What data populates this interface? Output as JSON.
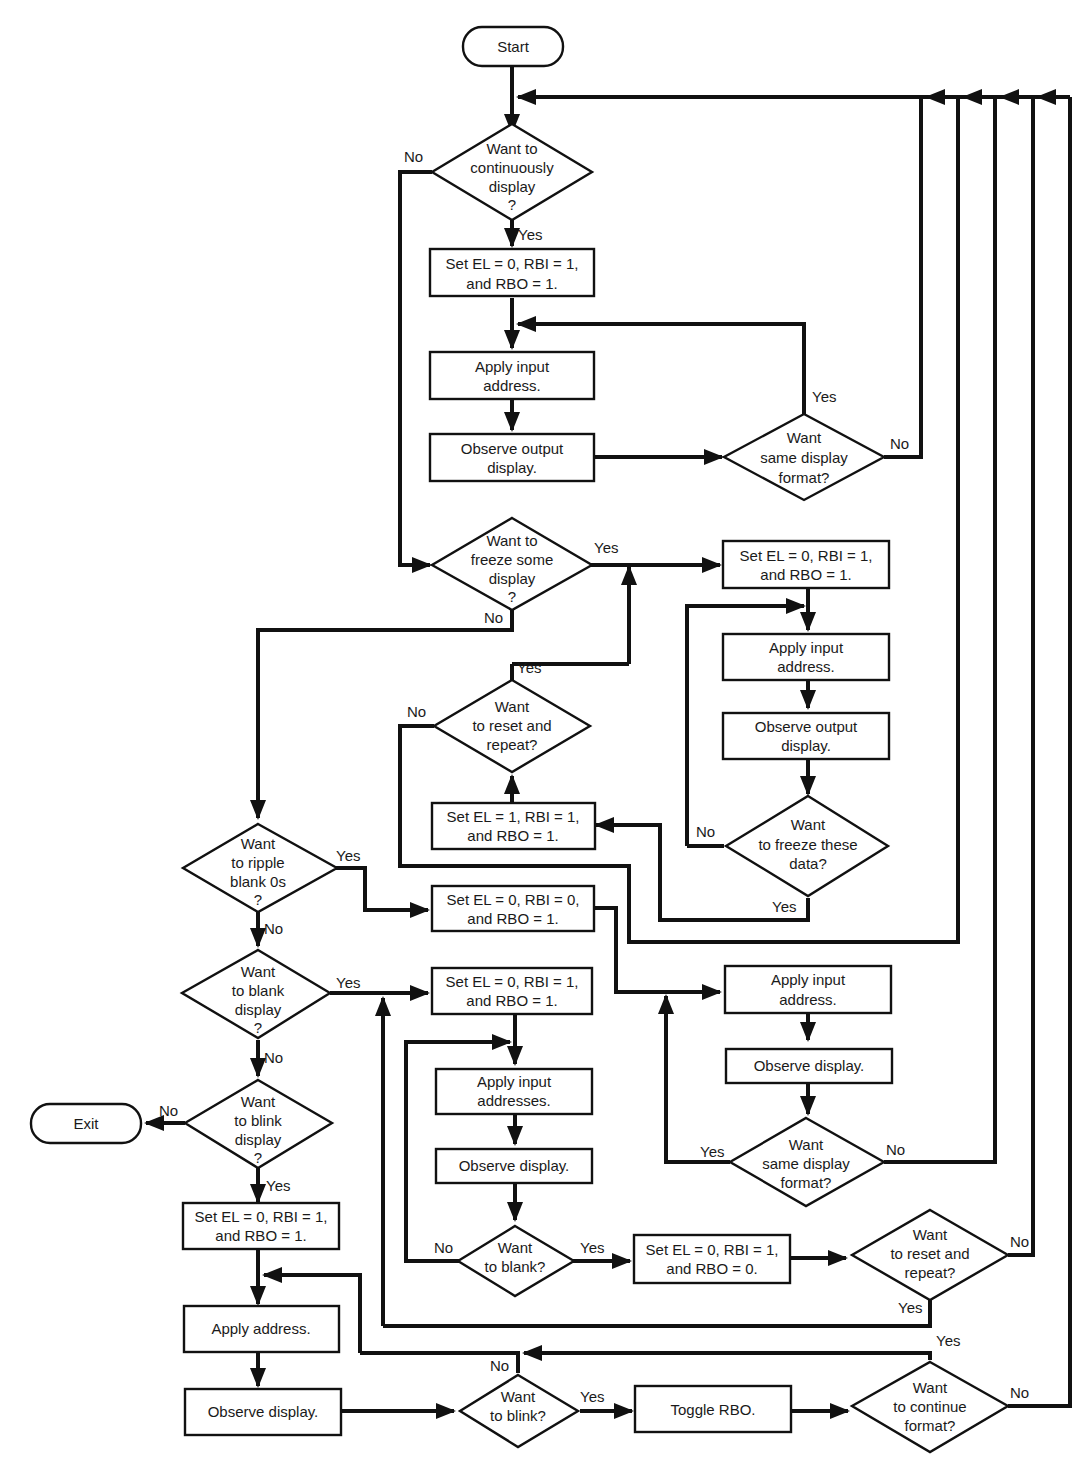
{
  "terminals": {
    "start": "Start",
    "exit": "Exit"
  },
  "decisions": {
    "continuously_display": [
      "Want to",
      "continuously",
      "display",
      "?"
    ],
    "same_format_1": [
      "Want",
      "same display",
      "format?"
    ],
    "freeze_some": [
      "Want to",
      "freeze some",
      "display",
      "?"
    ],
    "reset_repeat_1": [
      "Want",
      "to reset and",
      "repeat?"
    ],
    "freeze_these": [
      "Want",
      "to freeze these",
      "data?"
    ],
    "ripple_blank": [
      "Want",
      "to ripple",
      "blank 0s",
      "?"
    ],
    "blank_display": [
      "Want",
      "to blank",
      "display",
      "?"
    ],
    "blink_display": [
      "Want",
      "to blink",
      "display",
      "?"
    ],
    "same_format_2": [
      "Want",
      "same display",
      "format?"
    ],
    "to_blank": [
      "Want",
      "to blank?"
    ],
    "reset_repeat_2": [
      "Want",
      "to reset and",
      "repeat?"
    ],
    "to_blink": [
      "Want",
      "to blink?"
    ],
    "continue_format": [
      "Want",
      "to continue",
      "format?"
    ]
  },
  "processes": {
    "set_cont": [
      "Set EL = 0, RBI = 1,",
      "and RBO = 1."
    ],
    "apply_1": [
      "Apply input",
      "address."
    ],
    "observe_1": [
      "Observe output",
      "display."
    ],
    "set_freeze": [
      "Set EL = 0, RBI = 1,",
      "and RBO = 1."
    ],
    "apply_2": [
      "Apply input",
      "address."
    ],
    "observe_2": [
      "Observe output",
      "display."
    ],
    "set_el1": [
      "Set EL = 1, RBI = 1,",
      "and RBO = 1."
    ],
    "set_ripple": [
      "Set EL = 0, RBI = 0,",
      "and RBO = 1."
    ],
    "apply_3": [
      "Apply input",
      "address."
    ],
    "observe_3": [
      "Observe display."
    ],
    "set_blank": [
      "Set EL = 0, RBI = 1,",
      "and RBO = 1."
    ],
    "apply_4": [
      "Apply input",
      "addresses."
    ],
    "observe_4": [
      "Observe display."
    ],
    "set_rbo0": [
      "Set EL = 0, RBI = 1,",
      "and RBO = 0."
    ],
    "set_blink": [
      "Set EL = 0, RBI = 1,",
      "and RBO = 1."
    ],
    "apply_5": [
      "Apply address."
    ],
    "observe_5": [
      "Observe display."
    ],
    "toggle": [
      "Toggle RBO."
    ]
  },
  "labels": {
    "yes": "Yes",
    "no": "No"
  }
}
